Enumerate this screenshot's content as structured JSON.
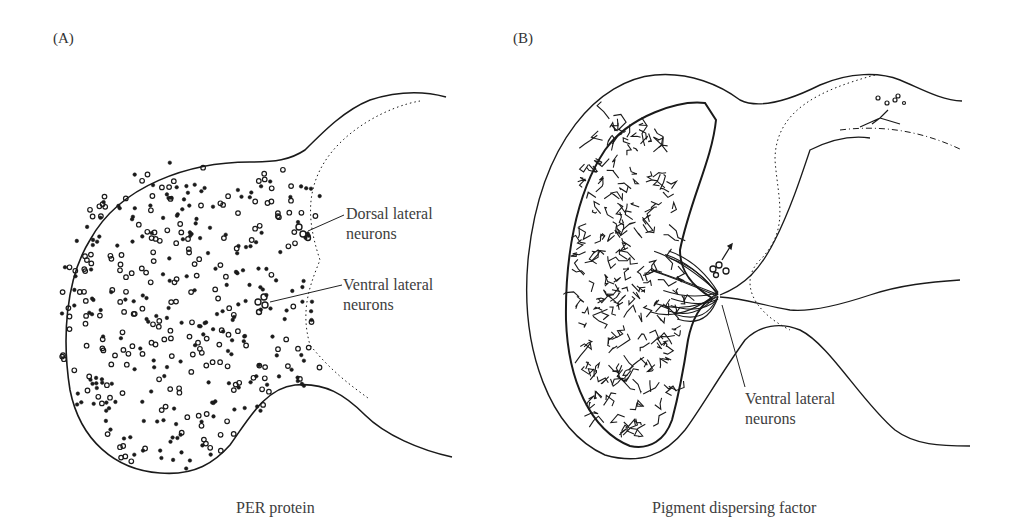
{
  "panels": [
    {
      "id": "A",
      "label": "(A)",
      "caption": "PER protein",
      "annotations": [
        {
          "line1": "Dorsal lateral",
          "line2": "neurons"
        },
        {
          "line1": "Ventral lateral",
          "line2": "neurons"
        }
      ]
    },
    {
      "id": "B",
      "label": "(B)",
      "caption": "Pigment dispersing factor",
      "annotations": [
        {
          "line1": "Ventral lateral",
          "line2": "neurons"
        }
      ]
    }
  ],
  "colors": {
    "ink": "#1a1a1a",
    "text": "#3d3d3d",
    "background": "#ffffff"
  }
}
